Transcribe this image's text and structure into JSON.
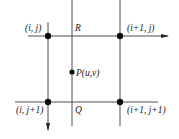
{
  "diagram": {
    "grid_points": [
      {
        "id": "tl",
        "label": "(i, j)"
      },
      {
        "id": "tr",
        "label": "(i+1, j)"
      },
      {
        "id": "bl",
        "label": "(i, j+1)"
      },
      {
        "id": "br",
        "label": "(i+1, j+1)"
      }
    ],
    "point_p": {
      "label": "P(u,v)"
    },
    "point_r": {
      "label": "R"
    },
    "point_q": {
      "label": "Q"
    },
    "colors": {
      "line": "#3a3a3a",
      "dot": "#111111",
      "background": "#ffffff"
    }
  }
}
